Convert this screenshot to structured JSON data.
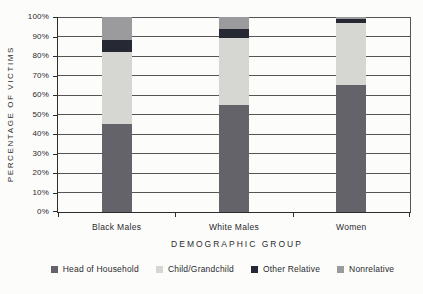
{
  "chart_data": {
    "type": "bar",
    "stacked": true,
    "title": "",
    "xlabel": "DEMOGRAPHIC GROUP",
    "ylabel": "PERCENTAGE OF VICTIMS",
    "categories": [
      "Black Males",
      "White Males",
      "Women"
    ],
    "series": [
      {
        "name": "Head of Household",
        "color": "#636369",
        "values": [
          45,
          55,
          65
        ]
      },
      {
        "name": "Child/Grandchild",
        "color": "#d6d6d3",
        "values": [
          37,
          34,
          32
        ]
      },
      {
        "name": "Other Relative",
        "color": "#262833",
        "values": [
          6,
          5,
          2
        ]
      },
      {
        "name": "Nonrelative",
        "color": "#9b9b9d",
        "values": [
          12,
          6,
          1
        ]
      }
    ],
    "ylim": [
      0,
      100
    ],
    "ytick_step": 10,
    "ytick_labels": [
      "0%",
      "10%",
      "20%",
      "30%",
      "40%",
      "50%",
      "60%",
      "70%",
      "80%",
      "90%",
      "100%"
    ],
    "grid": true,
    "legend_position": "bottom"
  },
  "colors": {
    "background": "#fcfcfb",
    "grid": "#555555",
    "axis": "#2d2d2d",
    "text": "#2b2b2b"
  }
}
